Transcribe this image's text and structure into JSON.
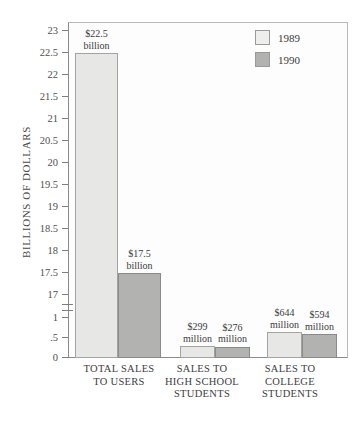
{
  "chart_data": {
    "type": "bar",
    "title": "",
    "xlabel": "",
    "ylabel": "BILLIONS OF DOLLARS",
    "grid": false,
    "legend_position": "top-right",
    "axis_break": true,
    "y_upper_range": [
      17,
      23
    ],
    "y_lower_range": [
      0,
      1
    ],
    "ytick_labels_upper": [
      "23",
      "22.5",
      "22",
      "21.5",
      "21",
      "20.5",
      "20",
      "19.5",
      "19",
      "18.5",
      "18",
      "17.5",
      "17"
    ],
    "ytick_labels_lower": [
      "1",
      ".5",
      "0"
    ],
    "categories": [
      "TOTAL SALES\nTO USERS",
      "SALES TO\nHIGH SCHOOL\nSTUDENTS",
      "SALES TO\nCOLLEGE\nSTUDENTS"
    ],
    "series": [
      {
        "name": "1989",
        "color": "#e7e7e5",
        "values": [
          22.5,
          0.299,
          0.644
        ],
        "value_labels": [
          "$22.5\nbillion",
          "$299\nmillion",
          "$644\nmillion"
        ]
      },
      {
        "name": "1990",
        "color": "#b2b2b0",
        "values": [
          17.5,
          0.276,
          0.594
        ],
        "value_labels": [
          "$17.5\nbillion",
          "$276\nmillion",
          "$594\nmillion"
        ]
      }
    ]
  },
  "legend": {
    "items": [
      {
        "label": "1989"
      },
      {
        "label": "1990"
      }
    ]
  }
}
